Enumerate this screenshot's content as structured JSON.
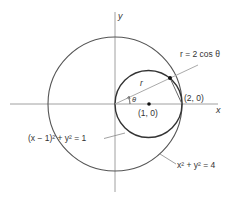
{
  "figure": {
    "axes": {
      "x_label": "x",
      "y_label": "y"
    },
    "labels": {
      "polar_curve": "r = 2 cos θ",
      "radius": "r",
      "angle": "θ",
      "point_2_0": "(2, 0)",
      "point_1_0": "(1, 0)",
      "small_circle_eq": "(x − 1)² + y² = 1",
      "large_circle_eq": "x² + y² = 4"
    },
    "colors": {
      "line": "#4a4a4a",
      "axis": "#9a9a9a",
      "text": "#333333"
    }
  }
}
